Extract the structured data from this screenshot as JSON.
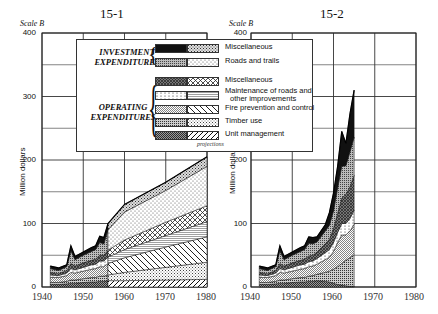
{
  "chart_data": [
    {
      "id": "15-1",
      "type": "area",
      "stacked": true,
      "title": "15-1",
      "scale_label": "Scale B",
      "xlabel": "",
      "ylabel": "Million dollars",
      "xlim": [
        1940,
        1980
      ],
      "ylim": [
        0,
        400
      ],
      "xticks": [
        "1940",
        "1950",
        "1960",
        "1970",
        "1980"
      ],
      "yticks": [
        "0",
        "100",
        "200",
        "300",
        "400"
      ],
      "grid": true,
      "projection_from": 1956,
      "x": [
        1942,
        1944,
        1946,
        1947,
        1948,
        1950,
        1952,
        1953,
        1954,
        1955,
        1956,
        1960,
        1970,
        1980
      ],
      "series": [
        {
          "name": "Operating: Unit management",
          "values": [
            4,
            4,
            5,
            6,
            6,
            7,
            8,
            8,
            9,
            9,
            10,
            10,
            11,
            12
          ]
        },
        {
          "name": "Operating: Timber use",
          "values": [
            3,
            3,
            4,
            5,
            5,
            6,
            7,
            7,
            8,
            8,
            9,
            13,
            20,
            27
          ]
        },
        {
          "name": "Operating: Fire prevention and control",
          "values": [
            8,
            8,
            9,
            12,
            11,
            12,
            13,
            14,
            15,
            15,
            18,
            23,
            32,
            40
          ]
        },
        {
          "name": "Operating: Maintenance of roads and other improvements",
          "values": [
            4,
            3,
            4,
            6,
            5,
            6,
            7,
            7,
            9,
            9,
            10,
            13,
            18,
            24
          ]
        },
        {
          "name": "Operating: Miscellaneous",
          "values": [
            4,
            3,
            4,
            8,
            6,
            7,
            7,
            8,
            9,
            9,
            11,
            15,
            21,
            25
          ]
        },
        {
          "name": "Investment: Roads and trails",
          "values": [
            6,
            5,
            6,
            20,
            10,
            12,
            14,
            15,
            20,
            18,
            32,
            44,
            50,
            62
          ]
        },
        {
          "name": "Investment: Miscellaneous",
          "values": [
            4,
            4,
            3,
            8,
            5,
            5,
            6,
            6,
            10,
            10,
            10,
            12,
            13,
            15
          ]
        }
      ],
      "totals": [
        33,
        30,
        35,
        65,
        48,
        55,
        62,
        65,
        80,
        78,
        100,
        130,
        165,
        205
      ]
    },
    {
      "id": "15-2",
      "type": "area",
      "stacked": true,
      "title": "15-2",
      "scale_label": "Scale B",
      "xlabel": "",
      "ylabel": "Million dollars",
      "xlim": [
        1940,
        1980
      ],
      "ylim": [
        0,
        400
      ],
      "xticks": [
        "1940",
        "1950",
        "1960",
        "1970",
        "1980"
      ],
      "yticks": [
        "0",
        "100",
        "200",
        "300",
        "400"
      ],
      "grid": true,
      "x": [
        1942,
        1944,
        1946,
        1947,
        1948,
        1950,
        1952,
        1953,
        1954,
        1955,
        1956,
        1958,
        1959,
        1960,
        1961,
        1962,
        1963,
        1964,
        1965
      ],
      "series": [
        {
          "name": "Operating: Unit management",
          "values": [
            4,
            4,
            5,
            6,
            6,
            7,
            8,
            8,
            9,
            9,
            10,
            9,
            8,
            6,
            4,
            3,
            2,
            1,
            1
          ]
        },
        {
          "name": "Operating: Timber use",
          "values": [
            3,
            3,
            4,
            5,
            5,
            6,
            7,
            7,
            8,
            9,
            10,
            14,
            17,
            22,
            28,
            34,
            40,
            45,
            50
          ]
        },
        {
          "name": "Operating: Fire prevention and control",
          "values": [
            8,
            8,
            9,
            12,
            11,
            12,
            13,
            14,
            15,
            15,
            16,
            20,
            22,
            28,
            38,
            45,
            40,
            42,
            48
          ]
        },
        {
          "name": "Operating: Maintenance of roads and other improvements",
          "values": [
            4,
            3,
            4,
            6,
            5,
            6,
            7,
            7,
            8,
            8,
            9,
            11,
            12,
            14,
            16,
            18,
            18,
            20,
            22
          ]
        },
        {
          "name": "Operating: Miscellaneous",
          "values": [
            4,
            3,
            4,
            8,
            6,
            7,
            7,
            8,
            9,
            9,
            10,
            14,
            16,
            22,
            30,
            40,
            46,
            50,
            55
          ]
        },
        {
          "name": "Investment: Roads and trails",
          "values": [
            6,
            5,
            6,
            20,
            10,
            12,
            14,
            15,
            20,
            18,
            16,
            20,
            22,
            28,
            40,
            50,
            45,
            55,
            60
          ]
        },
        {
          "name": "Investment: Miscellaneous",
          "values": [
            4,
            4,
            3,
            8,
            5,
            5,
            6,
            6,
            10,
            10,
            8,
            10,
            20,
            28,
            34,
            55,
            35,
            60,
            74
          ]
        }
      ],
      "totals": [
        33,
        30,
        35,
        65,
        48,
        55,
        62,
        65,
        79,
        78,
        79,
        98,
        117,
        148,
        190,
        245,
        226,
        273,
        310
      ]
    }
  ],
  "legend": {
    "projections_label": "projections",
    "groups": [
      {
        "label_line1": "INVESTMENT",
        "label_line2": "EXPENDITURES",
        "items": [
          {
            "label": "Miscellaneous",
            "hist_pattern": "solid-black",
            "proj_pattern": "fine-stipple"
          },
          {
            "label": "Roads and trails",
            "hist_pattern": "dense-dots",
            "proj_pattern": "light-dots"
          }
        ]
      },
      {
        "label_line1": "OPERATING",
        "label_line2": "EXPENDITURES",
        "items": [
          {
            "label": "Miscellaneous",
            "hist_pattern": "dark-crosshatch",
            "proj_pattern": "diamond-crosshatch"
          },
          {
            "label": "Maintenance of roads and",
            "label2": "other improvements",
            "hist_pattern": "sparse-dots",
            "proj_pattern": "horizontal-lines"
          },
          {
            "label": "Fire prevention and control",
            "hist_pattern": "fine-diagonal",
            "proj_pattern": "wide-diagonal"
          },
          {
            "label": "Timber use",
            "hist_pattern": "grid-dots",
            "proj_pattern": "fine-grid"
          },
          {
            "label": "Unit management",
            "hist_pattern": "dark-diagonal",
            "proj_pattern": "forward-slash"
          }
        ]
      }
    ]
  },
  "colors": {
    "ink": "#111111",
    "grid": "#222222",
    "background": "#ffffff"
  }
}
